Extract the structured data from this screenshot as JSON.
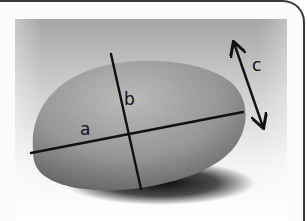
{
  "figure": {
    "labels": {
      "a": "a",
      "b": "b",
      "c": "c"
    },
    "axes": [
      {
        "name": "a",
        "description": "long axis",
        "x1": 31,
        "y1": 153,
        "x2": 243,
        "y2": 112
      },
      {
        "name": "b",
        "description": "intermediate axis",
        "x1": 111,
        "y1": 54,
        "x2": 141,
        "y2": 189
      },
      {
        "name": "c",
        "description": "short axis (thickness), double-headed arrow",
        "x1": 233,
        "y1": 40,
        "x2": 264,
        "y2": 130
      }
    ],
    "colors": {
      "frame_border": "#3a3a3a",
      "background_top": "#a9a9a9",
      "background_bottom": "#ffffff",
      "rock_light": "#b8b8b8",
      "rock_dark": "#6e6e6e",
      "shadow": "#111111",
      "line": "#111111"
    }
  }
}
